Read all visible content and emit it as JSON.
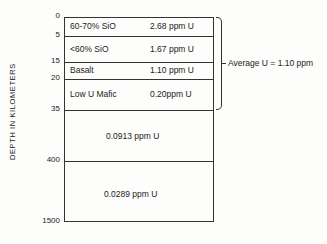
{
  "diagram": {
    "y_axis_label": "DEPTH IN KILOMETERS",
    "depth_ticks": [
      {
        "label": "0",
        "y": 17
      },
      {
        "label": "5",
        "y": 36
      },
      {
        "label": "15",
        "y": 62
      },
      {
        "label": "20",
        "y": 79
      },
      {
        "label": "35",
        "y": 110
      },
      {
        "label": "400",
        "y": 161
      },
      {
        "label": "1500",
        "y": 222
      }
    ],
    "layers": [
      {
        "name": "60-70% SiO",
        "value": "2.68 ppm U",
        "depth": "0-5"
      },
      {
        "name": "<60% SiO",
        "value": "1.67 ppm U",
        "depth": "5-15"
      },
      {
        "name": "Basalt",
        "value": "1.10 ppm U",
        "depth": "15-20"
      },
      {
        "name": "Low U Mafic",
        "value": "0.20ppm U",
        "depth": "20-35"
      },
      {
        "name": "",
        "value": "0.0913 ppm U",
        "depth": "35-400"
      },
      {
        "name": "",
        "value": "0.0289 ppm U",
        "depth": "400-1500"
      }
    ],
    "bracket_annotation": "Average U = 1.10 ppm"
  }
}
